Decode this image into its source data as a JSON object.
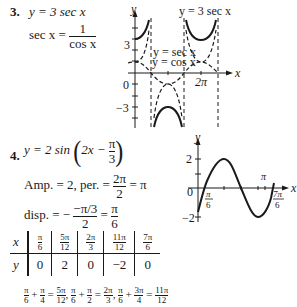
{
  "problem3": {
    "number": "3.",
    "equation": "y = 3 sec x",
    "identity_lhs": "sec x =",
    "identity_num": "1",
    "identity_den": "cos x",
    "graph": {
      "y_axis_label": "y",
      "x_axis_label": "x",
      "label_top": "y = 3 sec x",
      "label_sec": "y = sec x",
      "label_cos": "y = cos x",
      "tick_3": "3",
      "tick_0": "0",
      "tick_neg3": "−3",
      "tick_2pi": "2π"
    }
  },
  "problem4": {
    "number": "4.",
    "equation_prefix": "y = 2 sin",
    "equation_inner_left": "2x −",
    "equation_inner_num": "π",
    "equation_inner_den": "3",
    "amp_text": "Amp. = 2, per. =",
    "per_num": "2π",
    "per_den": "2",
    "per_result": "= π",
    "disp_text": "disp. = −",
    "disp_num": "−π/3",
    "disp_den": "2",
    "disp_eq": "=",
    "disp_res_num": "π",
    "disp_res_den": "6",
    "table": {
      "x_label": "x",
      "y_label": "y",
      "x_values": [
        {
          "num": "π",
          "den": "6"
        },
        {
          "num": "5π",
          "den": "12"
        },
        {
          "num": "2π",
          "den": "3"
        },
        {
          "num": "11π",
          "den": "12"
        },
        {
          "num": "7π",
          "den": "6"
        }
      ],
      "y_values": [
        "0",
        "2",
        "0",
        "−2",
        "0"
      ]
    },
    "footer_terms": [
      {
        "a": {
          "num": "π",
          "den": "6"
        },
        "b": {
          "num": "π",
          "den": "4"
        },
        "r": {
          "num": "5π",
          "den": "12"
        }
      },
      {
        "a": {
          "num": "π",
          "den": "6"
        },
        "b": {
          "num": "π",
          "den": "2"
        },
        "r": {
          "num": "2π",
          "den": "3"
        }
      },
      {
        "a": {
          "num": "π",
          "den": "6"
        },
        "b": {
          "num": "3π",
          "den": "4"
        },
        "r": {
          "num": "11π",
          "den": "12"
        }
      }
    ],
    "graph": {
      "y_axis_label": "y",
      "x_axis_label": "x",
      "tick_2": "2",
      "tick_0": "0",
      "tick_neg2": "−2",
      "tick_pi": "π",
      "tick_pi6_num": "π",
      "tick_pi6_den": "6",
      "tick_7pi6_num": "7π",
      "tick_7pi6_den": "6"
    }
  }
}
